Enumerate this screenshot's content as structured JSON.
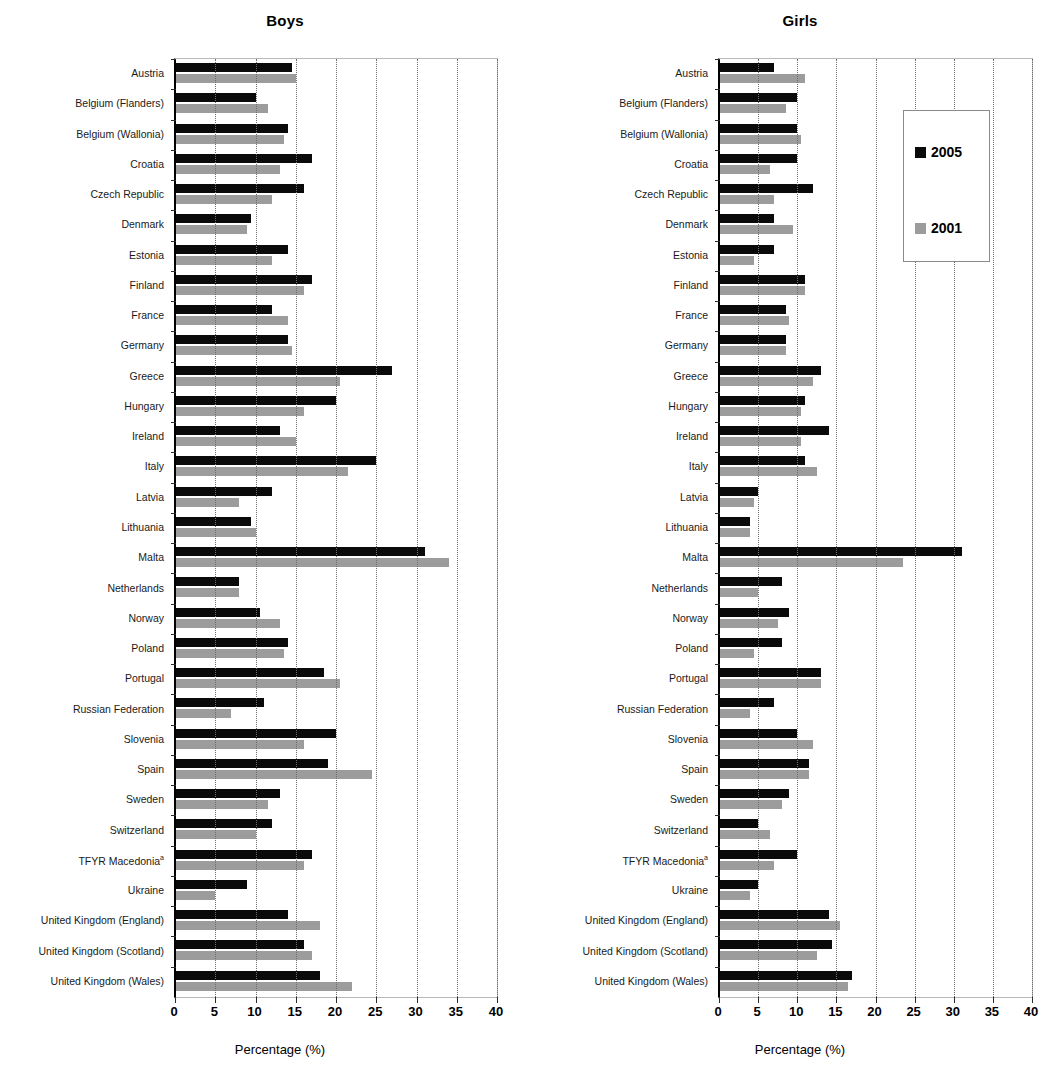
{
  "charts": [
    {
      "key": "boys",
      "title": "Boys",
      "axis_title": "Percentage (%)"
    },
    {
      "key": "girls",
      "title": "Girls",
      "axis_title": "Percentage (%)"
    }
  ],
  "legend": {
    "items": [
      {
        "label": "2005",
        "color": "#0a0a0a"
      },
      {
        "label": "2001",
        "color": "#9c9c9c"
      }
    ]
  },
  "xticks": [
    "0",
    "5",
    "10",
    "15",
    "20",
    "25",
    "30",
    "35",
    "40"
  ],
  "chart_data": [
    {
      "type": "bar",
      "title": "Boys",
      "xlabel": "Percentage (%)",
      "ylabel": "",
      "orientation": "horizontal",
      "xlim": [
        0,
        40
      ],
      "xticks": [
        0,
        5,
        10,
        15,
        20,
        25,
        30,
        35,
        40
      ],
      "grid": true,
      "legend_position": "none",
      "categories": [
        "Austria",
        "Belgium (Flanders)",
        "Belgium (Wallonia)",
        "Croatia",
        "Czech Republic",
        "Denmark",
        "Estonia",
        "Finland",
        "France",
        "Germany",
        "Greece",
        "Hungary",
        "Ireland",
        "Italy",
        "Latvia",
        "Lithuania",
        "Malta",
        "Netherlands",
        "Norway",
        "Poland",
        "Portugal",
        "Russian Federation",
        "Slovenia",
        "Spain",
        "Sweden",
        "Switzerland",
        "TFYR Macedonia",
        "Ukraine",
        "United Kingdom (England)",
        "United Kingdom (Scotland)",
        "United Kingdom (Wales)"
      ],
      "series": [
        {
          "name": "2005",
          "color": "#0a0a0a",
          "values": [
            14.5,
            10,
            14,
            17,
            16,
            9.5,
            14,
            17,
            12,
            14,
            27,
            20,
            13,
            25,
            12,
            9.5,
            31,
            8,
            10.5,
            14,
            18.5,
            11,
            20,
            19,
            13,
            12,
            17,
            9,
            14,
            16,
            18
          ]
        },
        {
          "name": "2001",
          "color": "#9c9c9c",
          "values": [
            15,
            11.5,
            13.5,
            13,
            12,
            9,
            12,
            16,
            14,
            14.5,
            20.5,
            16,
            15,
            21.5,
            8,
            10,
            34,
            8,
            13,
            13.5,
            20.5,
            7,
            16,
            24.5,
            11.5,
            10,
            16,
            5,
            18,
            17,
            22
          ]
        }
      ]
    },
    {
      "type": "bar",
      "title": "Girls",
      "xlabel": "Percentage (%)",
      "ylabel": "",
      "orientation": "horizontal",
      "xlim": [
        0,
        40
      ],
      "xticks": [
        0,
        5,
        10,
        15,
        20,
        25,
        30,
        35,
        40
      ],
      "grid": true,
      "legend_position": "inside-top-right",
      "categories": [
        "Austria",
        "Belgium (Flanders)",
        "Belgium (Wallonia)",
        "Croatia",
        "Czech Republic",
        "Denmark",
        "Estonia",
        "Finland",
        "France",
        "Germany",
        "Greece",
        "Hungary",
        "Ireland",
        "Italy",
        "Latvia",
        "Lithuania",
        "Malta",
        "Netherlands",
        "Norway",
        "Poland",
        "Portugal",
        "Russian Federation",
        "Slovenia",
        "Spain",
        "Sweden",
        "Switzerland",
        "TFYR Macedonia",
        "Ukraine",
        "United Kingdom (England)",
        "United Kingdom (Scotland)",
        "United Kingdom (Wales)"
      ],
      "series": [
        {
          "name": "2005",
          "color": "#0a0a0a",
          "values": [
            7,
            10,
            10,
            10,
            12,
            7,
            7,
            11,
            8.5,
            8.5,
            13,
            11,
            14,
            11,
            5,
            4,
            31,
            8,
            9,
            8,
            13,
            7,
            10,
            11.5,
            9,
            5,
            10,
            5,
            14,
            14.5,
            17
          ]
        },
        {
          "name": "2001",
          "color": "#9c9c9c",
          "values": [
            11,
            8.5,
            10.5,
            6.5,
            7,
            9.5,
            4.5,
            11,
            9,
            8.5,
            12,
            10.5,
            10.5,
            12.5,
            4.5,
            4,
            23.5,
            5,
            7.5,
            4.5,
            13,
            4,
            12,
            11.5,
            8,
            6.5,
            7,
            4,
            15.5,
            12.5,
            16.5
          ]
        }
      ]
    }
  ],
  "footnote_markers": {
    "tfyr_macedonia": "a"
  }
}
